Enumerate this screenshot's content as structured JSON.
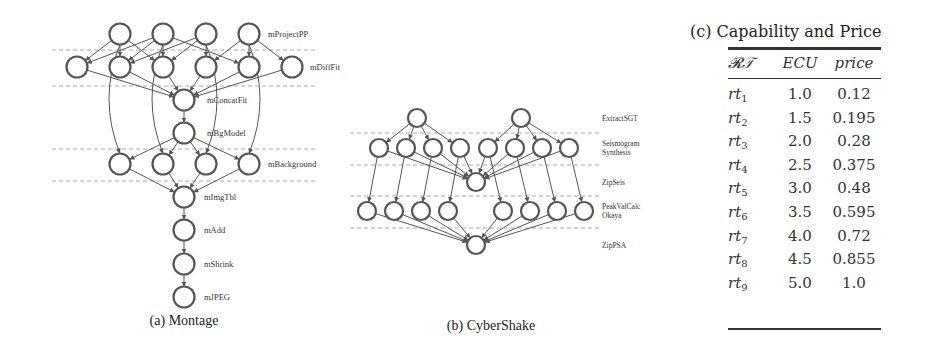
{
  "montage": {
    "caption": "(a) Montage",
    "levels": [
      {
        "label": "mProjectPP",
        "y": 34,
        "nodes_x": [
          120,
          163,
          206,
          249
        ]
      },
      {
        "label": "mDiffFit",
        "y": 67,
        "nodes_x": [
          77,
          120,
          163,
          206,
          249,
          292
        ]
      },
      {
        "label": "mConcatFit",
        "y": 100,
        "nodes_x": [
          184
        ]
      },
      {
        "label": "mBgModel",
        "y": 133,
        "nodes_x": [
          184
        ]
      },
      {
        "label": "mBackground",
        "y": 164,
        "nodes_x": [
          120,
          163,
          206,
          249
        ]
      },
      {
        "label": "mImgTbl",
        "y": 197,
        "nodes_x": [
          184
        ]
      },
      {
        "label": "mAdd",
        "y": 230,
        "nodes_x": [
          184
        ]
      },
      {
        "label": "mShrink",
        "y": 264,
        "nodes_x": [
          184
        ]
      },
      {
        "label": "mJPEG",
        "y": 297,
        "nodes_x": [
          184
        ]
      }
    ]
  },
  "cybershake": {
    "caption": "(b) CyberShake",
    "levels": [
      {
        "label": "ExtractSGT",
        "label2": "",
        "y": 118,
        "nodes_x": [
          417,
          521
        ]
      },
      {
        "label": "Seismogram",
        "label2": "Synthesis",
        "y": 148,
        "nodes_x": [
          379,
          406,
          433,
          460,
          488,
          515,
          542,
          569
        ]
      },
      {
        "label": "ZipSeis",
        "label2": "",
        "y": 182,
        "nodes_x": [
          476
        ]
      },
      {
        "label": "PeakValCalc",
        "label2": "Okaya",
        "y": 211,
        "nodes_x": [
          367,
          394,
          421,
          448,
          503,
          530,
          557,
          584
        ]
      },
      {
        "label": "ZipPSA",
        "label2": "",
        "y": 245,
        "nodes_x": [
          476
        ]
      }
    ]
  },
  "table": {
    "title": "(c) Capability and Price",
    "headers": {
      "rt": "𝓡𝒯",
      "ecu": "ECU",
      "price": "price"
    },
    "rows": [
      {
        "rt": "rt",
        "sub": "1",
        "ecu": "1.0",
        "price": "0.12"
      },
      {
        "rt": "rt",
        "sub": "2",
        "ecu": "1.5",
        "price": "0.195"
      },
      {
        "rt": "rt",
        "sub": "3",
        "ecu": "2.0",
        "price": "0.28"
      },
      {
        "rt": "rt",
        "sub": "4",
        "ecu": "2.5",
        "price": "0.375"
      },
      {
        "rt": "rt",
        "sub": "5",
        "ecu": "3.0",
        "price": "0.48"
      },
      {
        "rt": "rt",
        "sub": "6",
        "ecu": "3.5",
        "price": "0.595"
      },
      {
        "rt": "rt",
        "sub": "7",
        "ecu": "4.0",
        "price": "0.72"
      },
      {
        "rt": "rt",
        "sub": "8",
        "ecu": "4.5",
        "price": "0.855"
      },
      {
        "rt": "rt",
        "sub": "9",
        "ecu": "5.0",
        "price": "1.0"
      }
    ]
  },
  "colors": {
    "node_stroke": "#555555",
    "edge": "#555555",
    "dash": "#aaaaaa",
    "text": "#333333"
  }
}
